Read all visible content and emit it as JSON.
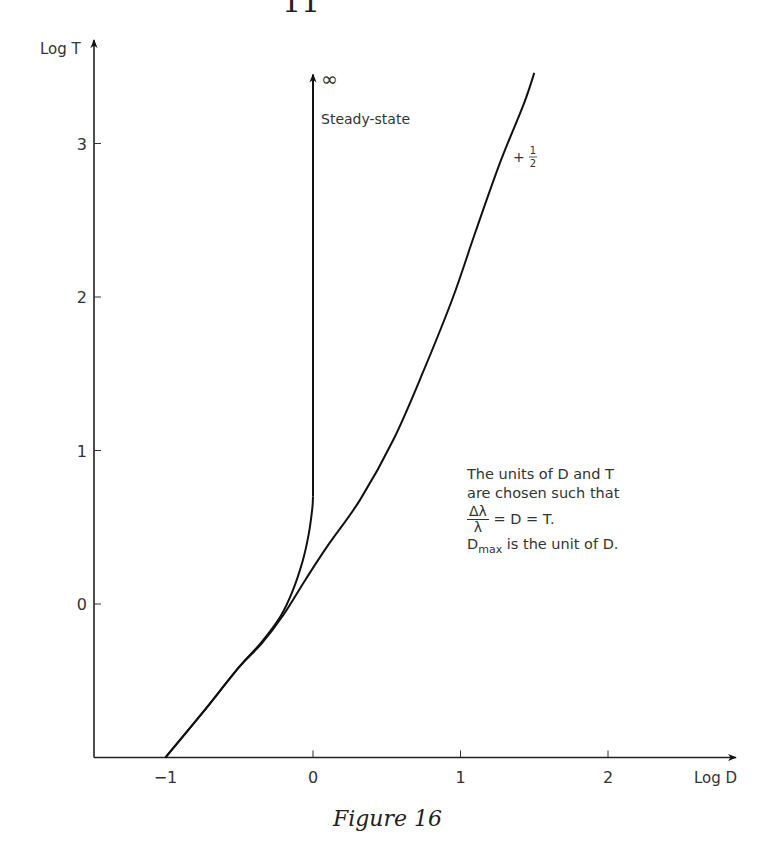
{
  "page": {
    "page_number_partial": "11",
    "caption": "Figure 16"
  },
  "chart_data": {
    "type": "line",
    "title": "",
    "xlabel": "Log D",
    "ylabel": "Log T",
    "xlim": [
      -1.5,
      2.9
    ],
    "ylim": [
      -1.0,
      3.7
    ],
    "x_ticks": [
      -1,
      0,
      1,
      2
    ],
    "x_tick_labels": [
      "−1",
      "0",
      "1",
      "2"
    ],
    "y_ticks": [
      0,
      1,
      2,
      3
    ],
    "y_tick_labels": [
      "0",
      "1",
      "2",
      "3"
    ],
    "grid": false,
    "series": [
      {
        "name": "+ 1/2",
        "label_num": "1",
        "label_den": "2",
        "label_prefix": "+",
        "points": [
          [
            -1.0,
            -1.0
          ],
          [
            -0.75,
            -0.71
          ],
          [
            -0.5,
            -0.41
          ],
          [
            -0.35,
            -0.26
          ],
          [
            -0.2,
            -0.07
          ],
          [
            -0.05,
            0.16
          ],
          [
            0.1,
            0.38
          ],
          [
            0.32,
            0.68
          ],
          [
            0.55,
            1.08
          ],
          [
            0.75,
            1.52
          ],
          [
            0.95,
            2.0
          ],
          [
            1.1,
            2.42
          ],
          [
            1.27,
            2.88
          ],
          [
            1.43,
            3.26
          ],
          [
            1.5,
            3.46
          ]
        ]
      },
      {
        "name": "Steady-state",
        "label": "Steady-state",
        "end_symbol": "∞",
        "points": [
          [
            -1.0,
            -1.0
          ],
          [
            -0.75,
            -0.71
          ],
          [
            -0.5,
            -0.41
          ],
          [
            -0.35,
            -0.25
          ],
          [
            -0.22,
            -0.08
          ],
          [
            -0.14,
            0.08
          ],
          [
            -0.07,
            0.28
          ],
          [
            -0.03,
            0.45
          ],
          [
            -0.005,
            0.62
          ],
          [
            0.0,
            0.7
          ],
          [
            0.0,
            3.45
          ]
        ],
        "arrow_at_end": true
      }
    ],
    "annotation": {
      "line1": "The units of D and T",
      "line2": "are chosen such that",
      "frac_num": "Δλ",
      "frac_den": "λ",
      "eq_rest": " = D = T.",
      "dmax_base": "D",
      "dmax_sub": "max",
      "dmax_rest": " is the unit of D."
    }
  }
}
